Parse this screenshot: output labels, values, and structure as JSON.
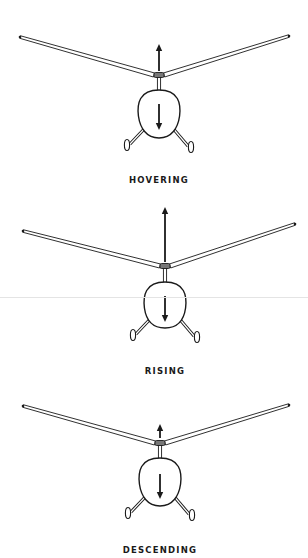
{
  "colors": {
    "ink": "#1a1a1a",
    "background": "#ffffff",
    "scan_line": "#e4e4e4"
  },
  "scan_line_y": 297,
  "panels": [
    {
      "label": "HOVERING",
      "label_y": 175,
      "left_tip": [
        20,
        37
      ],
      "right_tip": [
        289,
        36
      ],
      "hub": [
        159,
        75
      ],
      "body": {
        "cx": 159,
        "top": 90,
        "bottom": 138,
        "halfwidth": 21
      },
      "lift_arrow": {
        "from": 71,
        "to": 44,
        "description": "moderate upward lift"
      },
      "weight_arrow": {
        "from": 104,
        "to": 130
      }
    },
    {
      "label": "RISING",
      "label_y": 366,
      "left_tip": [
        23,
        231
      ],
      "right_tip": [
        295,
        224
      ],
      "hub": [
        165,
        266
      ],
      "body": {
        "cx": 165,
        "top": 282,
        "bottom": 328,
        "halfwidth": 21
      },
      "lift_arrow": {
        "from": 262,
        "to": 207,
        "description": "long upward lift"
      },
      "weight_arrow": {
        "from": 296,
        "to": 322
      }
    },
    {
      "label": "DESCENDING",
      "label_y": 545,
      "left_tip": [
        23,
        406
      ],
      "right_tip": [
        289,
        405
      ],
      "hub": [
        160,
        443
      ],
      "body": {
        "cx": 160,
        "top": 458,
        "bottom": 506,
        "halfwidth": 21
      },
      "lift_arrow": {
        "from": 438,
        "to": 424,
        "description": "short upward lift"
      },
      "weight_arrow": {
        "from": 474,
        "to": 499
      }
    }
  ]
}
